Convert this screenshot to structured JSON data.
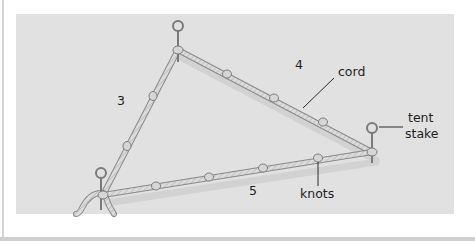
{
  "figure": {
    "colors": {
      "panel_background": "#e1e1e1",
      "page_background": "#ffffff",
      "cord_fill": "#d9d9d9",
      "cord_outline": "#8a8a8a",
      "label_text": "#1e1e1e",
      "leader_line": "#2a2a2a",
      "shadow": "#c9c9c9"
    },
    "side_labels": {
      "left": "3",
      "top": "4",
      "bottom": "5"
    },
    "callouts": {
      "cord": "cord",
      "tent_stake_line1": "tent",
      "tent_stake_line2": "stake",
      "knots": "knots"
    },
    "vertices": [
      {
        "name": "top",
        "x": 178,
        "y": 50,
        "has_stake": true
      },
      {
        "name": "right",
        "x": 372,
        "y": 152,
        "has_stake": true
      },
      {
        "name": "bottom-left",
        "x": 103,
        "y": 195,
        "has_stake": true
      }
    ],
    "knots": {
      "left_side": [
        {
          "x": 153,
          "y": 96
        },
        {
          "x": 127,
          "y": 146
        }
      ],
      "top_side": [
        {
          "x": 227,
          "y": 74
        },
        {
          "x": 274,
          "y": 98
        },
        {
          "x": 323,
          "y": 122
        }
      ],
      "bottom_side": [
        {
          "x": 156,
          "y": 186
        },
        {
          "x": 209,
          "y": 177
        },
        {
          "x": 263,
          "y": 168
        },
        {
          "x": 318,
          "y": 158
        }
      ]
    }
  }
}
